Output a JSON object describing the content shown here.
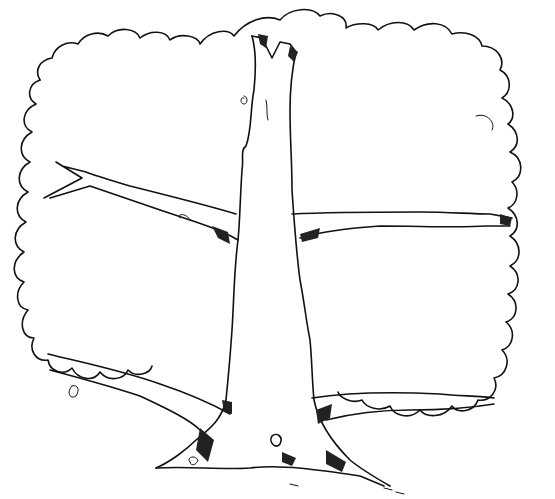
{
  "image": {
    "subject": "tree line drawing",
    "style": "black ink outline, coloring-page",
    "background_color": "#ffffff",
    "ink_color": "#111111",
    "elements": [
      "canopy-outline",
      "trunk",
      "upper-left-branch",
      "upper-right-branch",
      "lower-left-branch",
      "lower-right-branch",
      "roots"
    ]
  }
}
